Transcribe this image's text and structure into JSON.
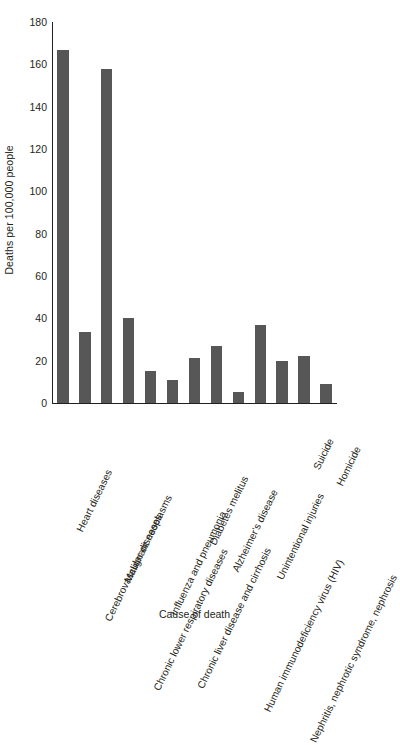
{
  "chart_data": {
    "type": "bar",
    "title": "",
    "subtitle": "",
    "xlabel": "Cause of death",
    "ylabel": "Deaths per 100,000 people",
    "ylim": [
      0,
      180
    ],
    "yticks": [
      0,
      20,
      40,
      60,
      80,
      100,
      120,
      140,
      160,
      180
    ],
    "ytick_labels": [
      "0",
      "20",
      "40",
      "60",
      "80",
      "100",
      "120",
      "140",
      "160",
      "180"
    ],
    "grid": false,
    "legend": null,
    "legend_position": "none",
    "bar_color": "#575757",
    "axis_color": "#231f20",
    "categories": [
      "Heart diseases",
      "Cerebrovascular diseases",
      "Malignant neoplasms",
      "Chronic lower respiratory diseases",
      "Influenza and pneumonia",
      "Chronic liver disease and cirrhosis",
      "Diabetes melitus",
      "Alzheimer's disease",
      "Human immunodeficiency virus (HIV)",
      "Unintentional injuries",
      "Nephritis, nephrotic syndrome, nephrosis",
      "Suicide",
      "Homicide"
    ],
    "values": [
      167,
      33.5,
      158,
      40,
      15,
      11,
      21.5,
      27,
      5,
      37,
      20,
      22,
      9
    ]
  }
}
